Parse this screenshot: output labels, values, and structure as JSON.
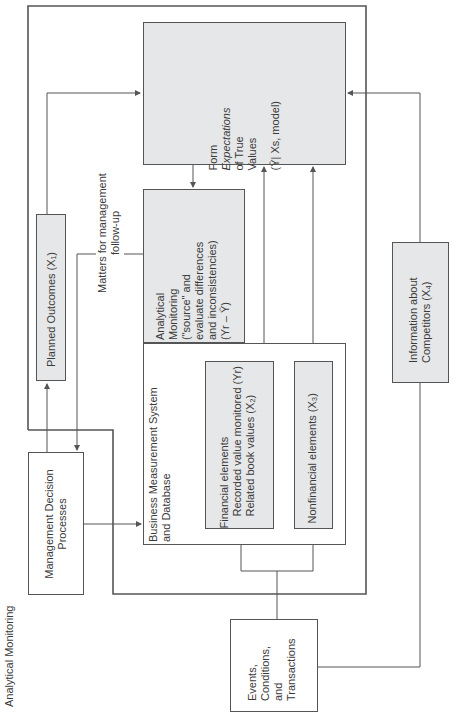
{
  "caption": "Analytical Monitoring",
  "nodes": {
    "form": {
      "line1": "Form",
      "line2": "Expectations",
      "line3": "of True",
      "line4": "Values",
      "line5": "(Ŷ| Xs, model)"
    },
    "analytical": {
      "line1": "Analytical",
      "line2": "Monitoring",
      "line3": "(\"source\" and",
      "line4": "evaluate differences",
      "line5": "and inconsistencies)",
      "line6": "(Yr – Ŷ)"
    },
    "planned": {
      "label": "Planned Outcomes (X₁)"
    },
    "matters": {
      "line1": "Matters for management",
      "line2": "follow-up"
    },
    "business": {
      "line1": "Business Measurement System",
      "line2": "and Database"
    },
    "financial": {
      "line1": "Financial elements",
      "line2": "Recorded value monitored (Yr)",
      "line3": "Related book values (X₂)"
    },
    "nonfinancial": {
      "label": "Nonfinancial elements (X₃)"
    },
    "management": {
      "line1": "Management Decision",
      "line2": "Processes"
    },
    "competitors": {
      "line1": "Information about",
      "line2": "Competitors (X₄)"
    },
    "events": {
      "line1": "Events,",
      "line2": "Conditions,",
      "line3": "and",
      "line4": "Transactions"
    }
  },
  "colors": {
    "shaded_fill": "#e6e7e8",
    "line": "#555555"
  }
}
